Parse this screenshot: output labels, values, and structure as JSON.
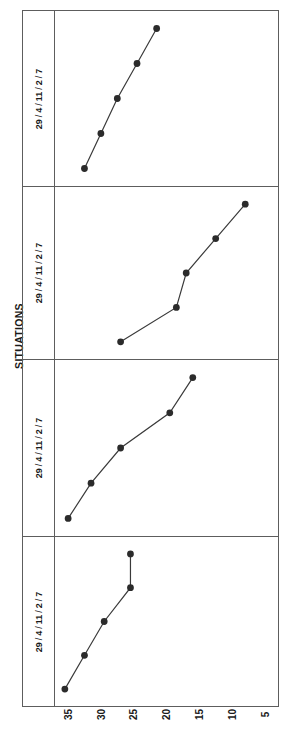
{
  "chart": {
    "title": "SITUATIONS",
    "orientation": "rotated-90",
    "strip_label_parts": [
      "29",
      "4",
      "11",
      "2",
      "7"
    ],
    "strip_separator": "/",
    "xaxis": {
      "ticks": [
        "35",
        "30",
        "25",
        "20",
        "15",
        "10",
        "5"
      ],
      "tick_values": [
        35,
        30,
        25,
        20,
        15,
        10,
        5
      ]
    },
    "marker_color": "#2b2b2b",
    "line_color": "#3a3a3a",
    "frame_color": "#5d5d5d"
  },
  "chart_data": {
    "type": "line",
    "title": "SITUATIONS",
    "xlabel": "",
    "ylabel": "SITUATIONS",
    "grid": false,
    "legend": "none",
    "orientation": "horizontal-panels-rotated",
    "axis_note": "Value axis (35 to 5) runs left-to-right decreasing; panel category axis 29/4/11/2/7 runs bottom-to-top",
    "categories": [
      "29",
      "4",
      "11",
      "2",
      "7"
    ],
    "xlim": [
      37,
      3
    ],
    "panels": [
      {
        "name": "panel-1",
        "strip_label": "29 / 4 / 11 / 2 / 7",
        "values": [
          32.5,
          30.0,
          27.5,
          24.5,
          21.5
        ]
      },
      {
        "name": "panel-2",
        "strip_label": "29 / 4 / 11 / 2 / 7",
        "values": [
          27.0,
          18.5,
          17.0,
          12.5,
          8.0
        ]
      },
      {
        "name": "panel-3",
        "strip_label": "29 / 4 / 11 / 2 / 7",
        "values": [
          35.0,
          31.5,
          27.0,
          19.5,
          16.0
        ]
      },
      {
        "name": "panel-4",
        "strip_label": "29 / 4 / 11 / 2 / 7",
        "values": [
          35.5,
          32.5,
          29.5,
          25.5,
          25.5
        ]
      }
    ]
  }
}
